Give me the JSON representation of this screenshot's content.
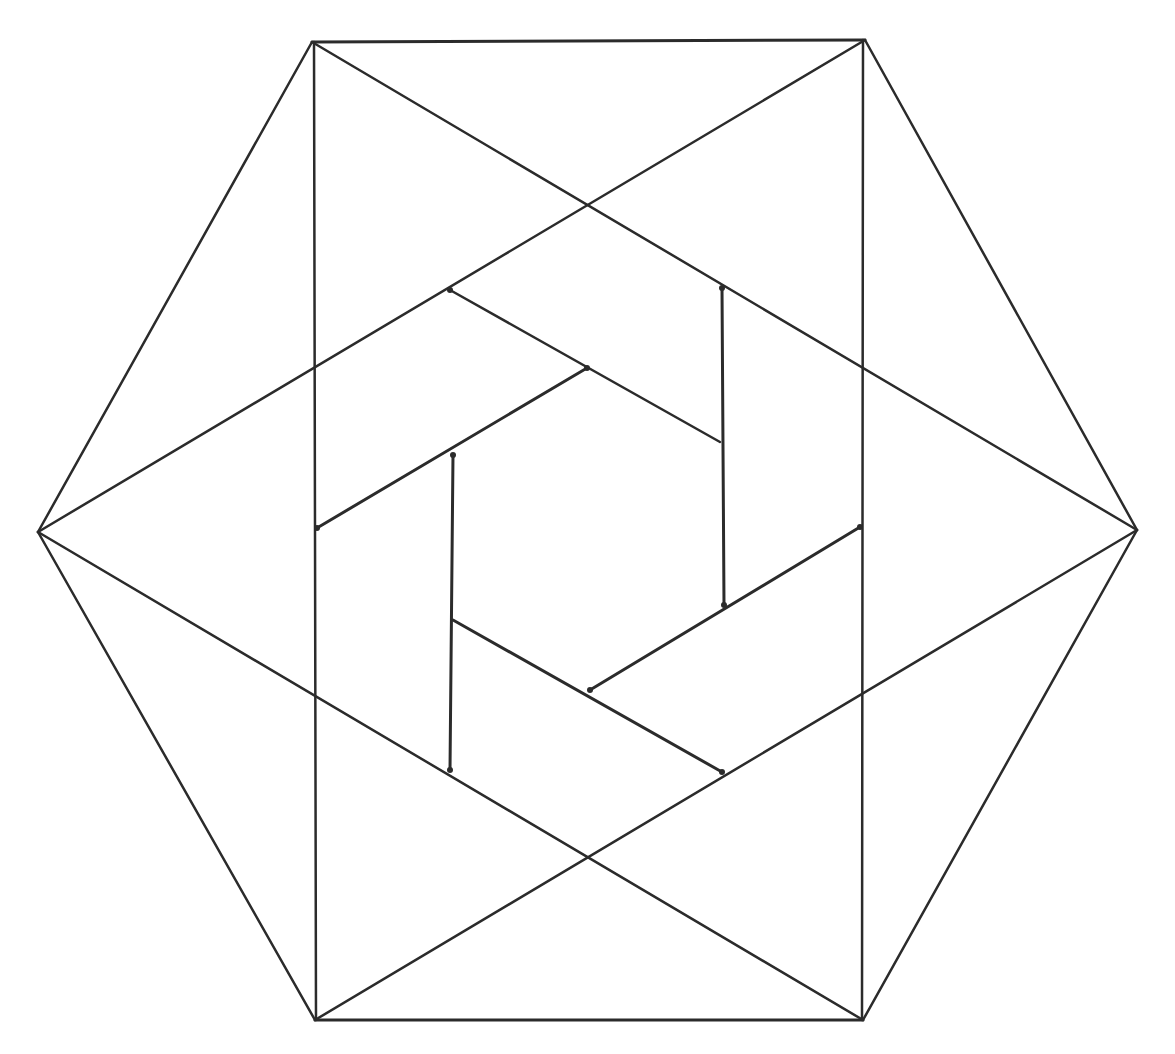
{
  "diagram": {
    "type": "geometric-line-drawing",
    "stroke_color": "#2b2b2b",
    "background_color": "#ffffff",
    "vertices": {
      "top_left": [
        312,
        42
      ],
      "top_right": [
        865,
        40
      ],
      "right": [
        1137,
        530
      ],
      "bottom_right": [
        863,
        1020
      ],
      "bottom_left": [
        315,
        1020
      ],
      "left": [
        38,
        532
      ]
    },
    "lines": [
      {
        "group": "hexagon",
        "x1": 312,
        "y1": 42,
        "x2": 865,
        "y2": 40,
        "w": 3
      },
      {
        "group": "hexagon",
        "x1": 865,
        "y1": 40,
        "x2": 1137,
        "y2": 530,
        "w": 2.5
      },
      {
        "group": "hexagon",
        "x1": 1137,
        "y1": 530,
        "x2": 863,
        "y2": 1020,
        "w": 2.5
      },
      {
        "group": "hexagon",
        "x1": 863,
        "y1": 1020,
        "x2": 315,
        "y2": 1020,
        "w": 3
      },
      {
        "group": "hexagon",
        "x1": 315,
        "y1": 1020,
        "x2": 38,
        "y2": 532,
        "w": 2.5
      },
      {
        "group": "hexagon",
        "x1": 38,
        "y1": 532,
        "x2": 312,
        "y2": 42,
        "w": 2.5
      },
      {
        "group": "rectangle",
        "x1": 314,
        "y1": 42,
        "x2": 316,
        "y2": 1020,
        "w": 2.5
      },
      {
        "group": "rectangle",
        "x1": 863,
        "y1": 40,
        "x2": 862,
        "y2": 1020,
        "w": 2.5
      },
      {
        "group": "triangle-a",
        "x1": 312,
        "y1": 42,
        "x2": 1137,
        "y2": 530,
        "w": 2.5
      },
      {
        "group": "triangle-a",
        "x1": 1137,
        "y1": 530,
        "x2": 315,
        "y2": 1020,
        "w": 2.5
      },
      {
        "group": "triangle-a",
        "x1": 38,
        "y1": 532,
        "x2": 865,
        "y2": 40,
        "w": 2.5
      },
      {
        "group": "triangle-b",
        "x1": 38,
        "y1": 532,
        "x2": 863,
        "y2": 1020,
        "w": 2.5
      },
      {
        "group": "pinwheel",
        "x1": 450,
        "y1": 290,
        "x2": 720,
        "y2": 442,
        "w": 2.5
      },
      {
        "group": "pinwheel",
        "x1": 722,
        "y1": 288,
        "x2": 724,
        "y2": 605,
        "w": 3
      },
      {
        "group": "pinwheel",
        "x1": 587,
        "y1": 368,
        "x2": 317,
        "y2": 528,
        "w": 3
      },
      {
        "group": "pinwheel",
        "x1": 453,
        "y1": 455,
        "x2": 450,
        "y2": 770,
        "w": 3
      },
      {
        "group": "pinwheel",
        "x1": 860,
        "y1": 527,
        "x2": 590,
        "y2": 690,
        "w": 3
      },
      {
        "group": "pinwheel",
        "x1": 453,
        "y1": 620,
        "x2": 722,
        "y2": 772,
        "w": 3
      }
    ],
    "joints": [
      [
        450,
        290
      ],
      [
        722,
        288
      ],
      [
        587,
        368
      ],
      [
        317,
        528
      ],
      [
        453,
        455
      ],
      [
        860,
        527
      ],
      [
        590,
        690
      ],
      [
        722,
        772
      ],
      [
        450,
        770
      ],
      [
        724,
        605
      ]
    ]
  }
}
